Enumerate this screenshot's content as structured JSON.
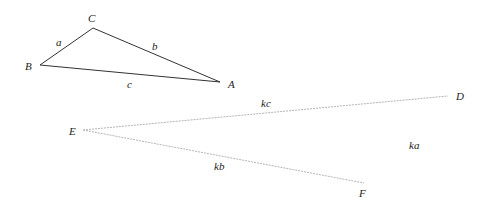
{
  "triangle1": {
    "vertices": {
      "A": {
        "label": "A",
        "x": 220,
        "y": 82
      },
      "B": {
        "label": "B",
        "x": 40,
        "y": 65
      },
      "C": {
        "label": "C",
        "x": 93,
        "y": 28
      }
    },
    "sides": {
      "a": "a",
      "b": "b",
      "c": "c"
    },
    "line_color": "#333333"
  },
  "triangle2": {
    "vertices": {
      "D": {
        "label": "D",
        "x": 448,
        "y": 96
      },
      "E": {
        "label": "E",
        "x": 83,
        "y": 130
      },
      "F": {
        "label": "F",
        "x": 364,
        "y": 183
      }
    },
    "sides": {
      "ka": "ka",
      "kb": "kb",
      "kc": "kc"
    },
    "line_color": "#b0b0b0"
  }
}
